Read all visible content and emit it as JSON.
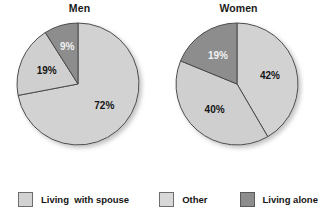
{
  "figure": {
    "background": "#ffffff",
    "text_color": "#1a1a1a"
  },
  "legend": {
    "position": "bottom",
    "items": [
      {
        "label": "Living  with spouse",
        "color": "#d2d2d2",
        "border": "#6d6d6d",
        "swatch_name": "legend-swatch-living-with-spouse"
      },
      {
        "label": "Other",
        "color": "#d8d8d8",
        "border": "#6d6d6d",
        "swatch_name": "legend-swatch-other"
      },
      {
        "label": "Living alone",
        "color": "#8d8d8d",
        "border": "#5a5a5a",
        "swatch_name": "legend-swatch-living-alone"
      }
    ]
  },
  "chart_data": [
    {
      "type": "pie",
      "title": "Men",
      "xlabel": "",
      "ylabel": "",
      "categories": [
        "Living  with spouse",
        "Other",
        "Living alone"
      ],
      "values": [
        72,
        19,
        9
      ],
      "labels": [
        "72%",
        "19%",
        "9%"
      ],
      "colors": [
        "#d2d2d2",
        "#cfcfcf",
        "#8d8d8d"
      ],
      "label_colors": [
        "#141414",
        "#141414",
        "#f2f2f2"
      ],
      "start_angle_deg": 0,
      "direction": "clockwise",
      "units": "percent",
      "legend": [
        "Living  with spouse",
        "Other",
        "Living alone"
      ]
    },
    {
      "type": "pie",
      "title": "Women",
      "xlabel": "",
      "ylabel": "",
      "categories": [
        "Living  with spouse",
        "Other",
        "Living alone"
      ],
      "values": [
        42,
        40,
        19
      ],
      "labels": [
        "42%",
        "40%",
        "19%"
      ],
      "colors": [
        "#d2d2d2",
        "#cfcfcf",
        "#8d8d8d"
      ],
      "label_colors": [
        "#141414",
        "#141414",
        "#f2f2f2"
      ],
      "start_angle_deg": 0,
      "direction": "clockwise",
      "units": "percent",
      "legend": [
        "Living  with spouse",
        "Other",
        "Living alone"
      ]
    }
  ]
}
